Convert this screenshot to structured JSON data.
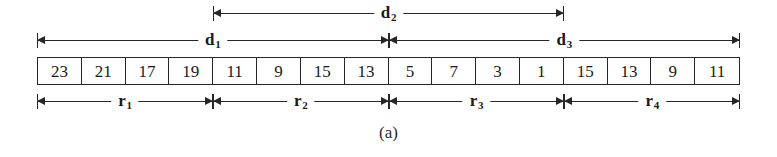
{
  "figure": {
    "caption": "(a)",
    "array": {
      "values": [
        23,
        21,
        17,
        19,
        11,
        9,
        15,
        13,
        5,
        7,
        3,
        1,
        15,
        13,
        9,
        11
      ],
      "cell_count": 16
    },
    "spans": {
      "top_row": [
        {
          "label": "d",
          "subscript": "2",
          "start_cell": 4,
          "end_cell": 12
        }
      ],
      "second_row": [
        {
          "label": "d",
          "subscript": "1",
          "start_cell": 0,
          "end_cell": 8
        },
        {
          "label": "d",
          "subscript": "3",
          "start_cell": 8,
          "end_cell": 16
        }
      ],
      "bottom_row": [
        {
          "label": "r",
          "subscript": "1",
          "start_cell": 0,
          "end_cell": 4
        },
        {
          "label": "r",
          "subscript": "2",
          "start_cell": 4,
          "end_cell": 8
        },
        {
          "label": "r",
          "subscript": "3",
          "start_cell": 8,
          "end_cell": 12
        },
        {
          "label": "r",
          "subscript": "4",
          "start_cell": 12,
          "end_cell": 16
        }
      ]
    },
    "colors": {
      "ink": "#262626",
      "background": "#ffffff"
    }
  }
}
